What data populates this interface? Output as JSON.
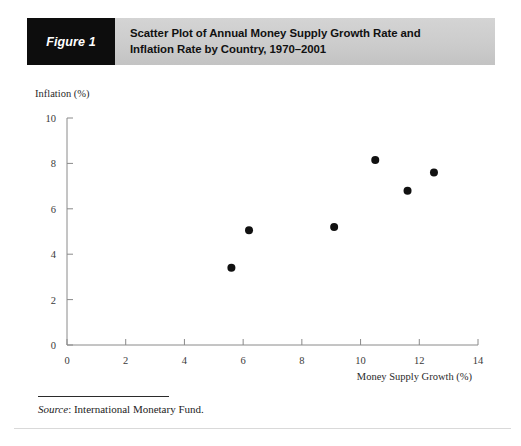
{
  "figure": {
    "label": "Figure 1",
    "title_line1": "Scatter Plot of Annual Money Supply Growth Rate and",
    "title_line2": "Inflation Rate by Country, 1970–2001",
    "label_bg_color": "#0d0d0d",
    "banner_bg_color": "#cccccc"
  },
  "source": {
    "prefix": "Source",
    "separator": ": ",
    "text": "International Monetary Fund."
  },
  "chart_data": {
    "type": "scatter",
    "title": "Scatter Plot of Annual Money Supply Growth Rate and Inflation Rate by Country, 1970–2001",
    "xlabel": "Money Supply Growth (%)",
    "ylabel": "Inflation (%)",
    "xlim": [
      0,
      14
    ],
    "ylim": [
      0,
      10
    ],
    "xticks": [
      0,
      2,
      4,
      6,
      8,
      10,
      12,
      14
    ],
    "yticks": [
      0,
      2,
      4,
      6,
      8,
      10
    ],
    "xtick_labels": [
      "0",
      "2",
      "4",
      "6",
      "8",
      "10",
      "12",
      "14"
    ],
    "ytick_labels": [
      "0",
      "2",
      "4",
      "6",
      "8",
      "10"
    ],
    "grid": false,
    "legend": false,
    "marker_color": "#111111",
    "marker_size": 4,
    "points": [
      {
        "x": 5.6,
        "y": 3.4
      },
      {
        "x": 6.2,
        "y": 5.05
      },
      {
        "x": 9.1,
        "y": 5.2
      },
      {
        "x": 10.5,
        "y": 8.15
      },
      {
        "x": 11.6,
        "y": 6.8
      },
      {
        "x": 12.5,
        "y": 7.6
      }
    ]
  }
}
